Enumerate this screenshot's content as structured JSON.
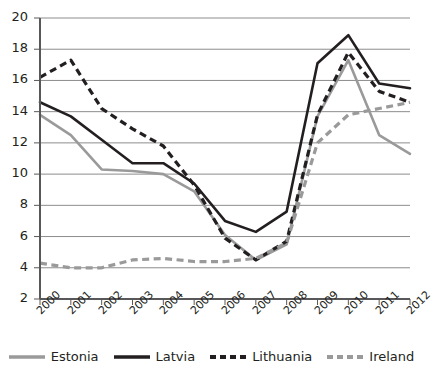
{
  "chart_data": {
    "type": "line",
    "title": "",
    "xlabel": "",
    "ylabel": "",
    "categories": [
      "2000",
      "2001",
      "2002",
      "2003",
      "2004",
      "2005",
      "2006",
      "2007",
      "2008",
      "2009",
      "2010",
      "2011",
      "2012"
    ],
    "ylim": [
      2,
      20
    ],
    "ytick_step": 2,
    "yticks": [
      "20",
      "18",
      "16",
      "14",
      "12",
      "10",
      "8",
      "6",
      "4",
      "2"
    ],
    "grid": true,
    "legend_position": "bottom",
    "series": [
      {
        "name": "Estonia",
        "color": "#9a9a9a",
        "style": "solid",
        "values": [
          13.8,
          12.5,
          10.3,
          10.2,
          10.0,
          8.9,
          6.1,
          4.5,
          5.5,
          13.7,
          17.3,
          12.5,
          11.3
        ]
      },
      {
        "name": "Latvia",
        "color": "#231f20",
        "style": "solid",
        "values": [
          14.6,
          13.7,
          12.2,
          10.7,
          10.7,
          9.4,
          7.0,
          6.3,
          7.6,
          17.1,
          18.9,
          15.8,
          15.5
        ]
      },
      {
        "name": "Lithuania",
        "color": "#231f20",
        "style": "dashed",
        "values": [
          16.2,
          17.3,
          14.2,
          12.9,
          11.8,
          9.3,
          5.9,
          4.5,
          5.7,
          13.8,
          17.8,
          15.3,
          14.6
        ]
      },
      {
        "name": "Ireland",
        "color": "#9a9a9a",
        "style": "dashed",
        "values": [
          4.3,
          4.0,
          4.0,
          4.5,
          4.6,
          4.4,
          4.4,
          4.6,
          5.6,
          12.0,
          13.8,
          14.2,
          14.6
        ]
      }
    ]
  },
  "axes": {
    "plot_left": 40,
    "plot_right": 410,
    "plot_top": 18,
    "plot_bottom": 299,
    "grid_color": "#8c8c8c",
    "axis_color": "#58585a"
  }
}
